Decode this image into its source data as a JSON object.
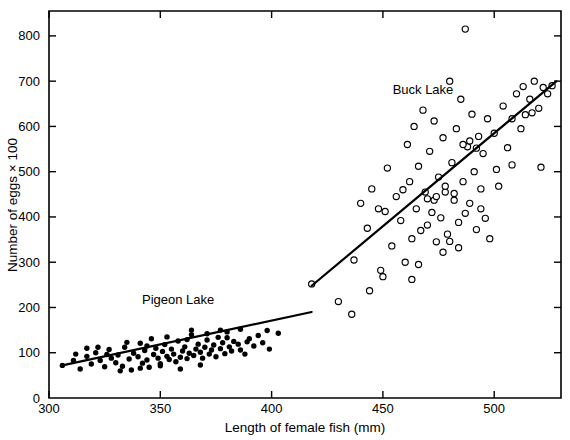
{
  "chart_data": {
    "type": "scatter",
    "title": "",
    "xlabel": "Length of female fish (mm)",
    "ylabel": "Number of eggs × 100",
    "xlim": [
      300,
      530
    ],
    "ylim": [
      0,
      855
    ],
    "xticks": [
      300,
      350,
      400,
      450,
      500
    ],
    "yticks": [
      0,
      100,
      200,
      300,
      400,
      500,
      600,
      700,
      800
    ],
    "xtick_labels": [
      "300",
      "350",
      "400",
      "450",
      "500"
    ],
    "ytick_labels": [
      "0",
      "100",
      "200",
      "300",
      "400",
      "500",
      "600",
      "700",
      "800"
    ],
    "grid": false,
    "legend": "inline-annotations",
    "annotations": [
      {
        "text": "Pigeon Lake",
        "x": 358,
        "y": 208
      },
      {
        "text": "Buck Lake",
        "x": 468,
        "y": 672
      }
    ],
    "series": [
      {
        "name": "Pigeon Lake",
        "marker": "filled-circle",
        "color": "#000000",
        "points": [
          [
            306,
            72
          ],
          [
            311,
            83
          ],
          [
            314,
            64
          ],
          [
            317,
            92
          ],
          [
            319,
            75
          ],
          [
            321,
            100
          ],
          [
            323,
            83
          ],
          [
            325,
            69
          ],
          [
            327,
            107
          ],
          [
            328,
            88
          ],
          [
            330,
            78
          ],
          [
            331,
            95
          ],
          [
            333,
            70
          ],
          [
            334,
            112
          ],
          [
            336,
            86
          ],
          [
            337,
            62
          ],
          [
            338,
            99
          ],
          [
            340,
            91
          ],
          [
            341,
            121
          ],
          [
            342,
            77
          ],
          [
            343,
            105
          ],
          [
            344,
            84
          ],
          [
            345,
            68
          ],
          [
            346,
            131
          ],
          [
            347,
            96
          ],
          [
            348,
            110
          ],
          [
            349,
            88
          ],
          [
            350,
            76
          ],
          [
            351,
            103
          ],
          [
            352,
            118
          ],
          [
            353,
            92
          ],
          [
            354,
            85
          ],
          [
            355,
            108
          ],
          [
            356,
            97
          ],
          [
            357,
            80
          ],
          [
            358,
            126
          ],
          [
            359,
            90
          ],
          [
            360,
            104
          ],
          [
            361,
            113
          ],
          [
            362,
            87
          ],
          [
            363,
            99
          ],
          [
            364,
            140
          ],
          [
            365,
            94
          ],
          [
            366,
            108
          ],
          [
            367,
            119
          ],
          [
            368,
            101
          ],
          [
            369,
            88
          ],
          [
            370,
            112
          ],
          [
            371,
            128
          ],
          [
            372,
            97
          ],
          [
            373,
            106
          ],
          [
            374,
            117
          ],
          [
            375,
            91
          ],
          [
            376,
            134
          ],
          [
            377,
            109
          ],
          [
            378,
            122
          ],
          [
            379,
            98
          ],
          [
            380,
            146
          ],
          [
            381,
            113
          ],
          [
            382,
            104
          ],
          [
            383,
            125
          ],
          [
            385,
            119
          ],
          [
            386,
            152
          ],
          [
            388,
            97
          ],
          [
            390,
            131
          ],
          [
            392,
            115
          ],
          [
            394,
            138
          ],
          [
            396,
            122
          ],
          [
            399,
            108
          ],
          [
            403,
            143
          ],
          [
            317,
            110
          ],
          [
            326,
            96
          ],
          [
            335,
            123
          ],
          [
            344,
            115
          ],
          [
            353,
            135
          ],
          [
            362,
            129
          ],
          [
            371,
            142
          ],
          [
            380,
            133
          ],
          [
            389,
            124
          ],
          [
            398,
            149
          ],
          [
            332,
            60
          ],
          [
            341,
            66
          ],
          [
            350,
            71
          ],
          [
            359,
            64
          ],
          [
            368,
            73
          ],
          [
            312,
            97
          ],
          [
            322,
            112
          ],
          [
            364,
            150
          ],
          [
            377,
            150
          ],
          [
            386,
            106
          ]
        ],
        "fit_line": {
          "x0": 306,
          "y0": 72,
          "x1": 418,
          "y1": 190
        }
      },
      {
        "name": "Buck Lake",
        "marker": "open-circle",
        "color": "#000000",
        "points": [
          [
            418,
            252
          ],
          [
            430,
            213
          ],
          [
            437,
            305
          ],
          [
            440,
            430
          ],
          [
            443,
            375
          ],
          [
            445,
            462
          ],
          [
            448,
            418
          ],
          [
            450,
            268
          ],
          [
            452,
            508
          ],
          [
            454,
            336
          ],
          [
            456,
            445
          ],
          [
            458,
            392
          ],
          [
            460,
            300
          ],
          [
            461,
            560
          ],
          [
            462,
            478
          ],
          [
            463,
            352
          ],
          [
            464,
            600
          ],
          [
            465,
            418
          ],
          [
            466,
            512
          ],
          [
            467,
            370
          ],
          [
            468,
            636
          ],
          [
            469,
            455
          ],
          [
            470,
            382
          ],
          [
            471,
            545
          ],
          [
            472,
            410
          ],
          [
            473,
            612
          ],
          [
            474,
            345
          ],
          [
            475,
            488
          ],
          [
            476,
            398
          ],
          [
            477,
            575
          ],
          [
            478,
            455
          ],
          [
            479,
            362
          ],
          [
            480,
            700
          ],
          [
            481,
            520
          ],
          [
            482,
            437
          ],
          [
            483,
            595
          ],
          [
            484,
            388
          ],
          [
            485,
            660
          ],
          [
            486,
            478
          ],
          [
            487,
            815
          ],
          [
            488,
            555
          ],
          [
            489,
            430
          ],
          [
            490,
            627
          ],
          [
            491,
            500
          ],
          [
            492,
            372
          ],
          [
            493,
            578
          ],
          [
            494,
            462
          ],
          [
            495,
            540
          ],
          [
            496,
            397
          ],
          [
            497,
            617
          ],
          [
            498,
            352
          ],
          [
            500,
            585
          ],
          [
            502,
            468
          ],
          [
            504,
            645
          ],
          [
            506,
            553
          ],
          [
            508,
            515
          ],
          [
            510,
            672
          ],
          [
            512,
            595
          ],
          [
            514,
            626
          ],
          [
            516,
            660
          ],
          [
            518,
            700
          ],
          [
            520,
            640
          ],
          [
            522,
            686
          ],
          [
            524,
            672
          ],
          [
            526,
            690
          ],
          [
            444,
            237
          ],
          [
            451,
            412
          ],
          [
            459,
            460
          ],
          [
            466,
            295
          ],
          [
            473,
            437
          ],
          [
            480,
            346
          ],
          [
            487,
            408
          ],
          [
            494,
            418
          ],
          [
            501,
            505
          ],
          [
            508,
            617
          ],
          [
            436,
            185
          ],
          [
            449,
            282
          ],
          [
            463,
            262
          ],
          [
            477,
            322
          ],
          [
            484,
            332
          ],
          [
            470,
            440
          ],
          [
            474,
            445
          ],
          [
            478,
            468
          ],
          [
            482,
            452
          ],
          [
            486,
            560
          ],
          [
            489,
            568
          ],
          [
            492,
            552
          ],
          [
            521,
            510
          ],
          [
            517,
            630
          ],
          [
            513,
            688
          ]
        ],
        "fit_line": {
          "x0": 418,
          "y0": 248,
          "x1": 528,
          "y1": 700
        }
      }
    ]
  }
}
